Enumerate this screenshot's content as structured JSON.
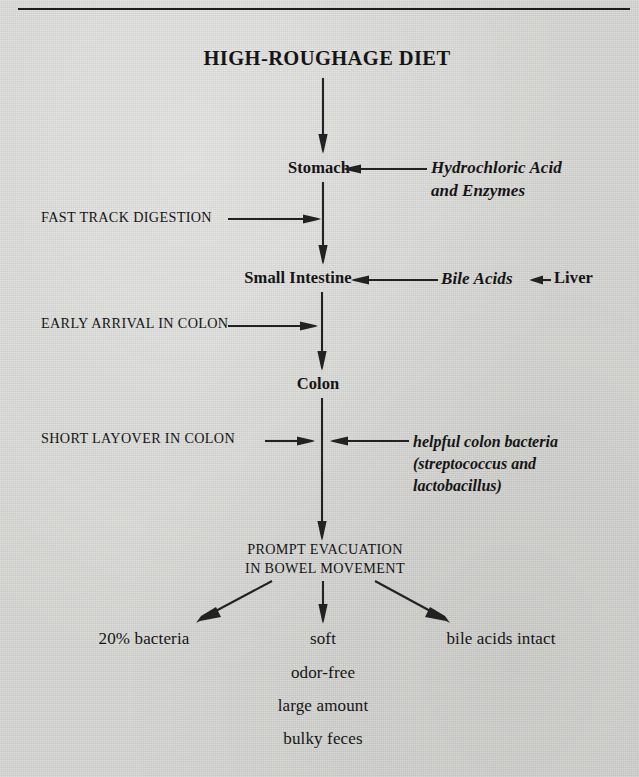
{
  "diagram": {
    "title": "HIGH-ROUGHAGE DIET",
    "stages": [
      {
        "id": "stomach",
        "label": "Stomach"
      },
      {
        "id": "small-intestine",
        "label": "Small Intestine"
      },
      {
        "id": "colon",
        "label": "Colon"
      },
      {
        "id": "evacuation",
        "label_line1": "PROMPT EVACUATION",
        "label_line2": "IN BOWEL MOVEMENT"
      }
    ],
    "left_annotations": [
      {
        "id": "fast-track-digestion",
        "label": "FAST TRACK DIGESTION"
      },
      {
        "id": "early-arrival-in-colon",
        "label": "EARLY ARRIVAL IN COLON"
      },
      {
        "id": "short-layover-in-colon",
        "label": "SHORT LAYOVER IN COLON"
      }
    ],
    "right_annotations": [
      {
        "id": "hydrochloric-acid-and-enzymes",
        "line1": "Hydrochloric Acid",
        "line2": "and Enzymes"
      },
      {
        "id": "bile-acids",
        "label": "Bile Acids"
      },
      {
        "id": "liver",
        "label": "Liver"
      },
      {
        "id": "helpful-colon-bacteria",
        "line1": "helpful colon bacteria",
        "line2": "(streptococcus and",
        "line3": "lactobacillus)"
      }
    ],
    "outcomes": {
      "left": "20% bacteria",
      "right": "bile acids intact",
      "center": [
        "soft",
        "odor-free",
        "large amount",
        "bulky feces"
      ]
    },
    "colors": {
      "ink": "#1a1a1a",
      "paper": "#d7d7d4"
    }
  }
}
